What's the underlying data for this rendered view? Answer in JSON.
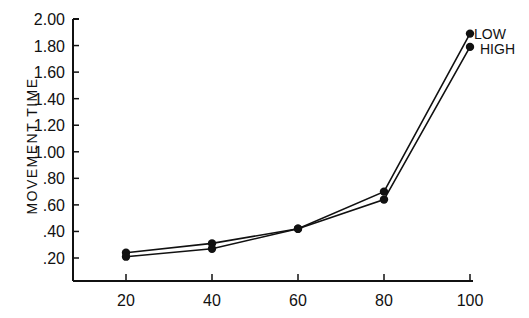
{
  "chart_data": {
    "type": "line",
    "title": "",
    "xlabel": "",
    "ylabel": "MOVEMENT TIME",
    "x": [
      20,
      40,
      60,
      80,
      100
    ],
    "x_tick_labels": [
      "20",
      "40",
      "60",
      "80",
      "100"
    ],
    "y_tick_labels": [
      ".20",
      ".40",
      ".60",
      ".80",
      "1.00",
      "1.20",
      "1.40",
      "1.60",
      "1.80",
      "2.00"
    ],
    "ylim": [
      0.0,
      2.0
    ],
    "xlim": [
      10,
      100
    ],
    "grid": false,
    "legend_position": "inline-right-end",
    "series": [
      {
        "name": "LOW",
        "values": [
          0.24,
          0.31,
          0.42,
          0.7,
          1.89
        ]
      },
      {
        "name": "HIGH",
        "values": [
          0.21,
          0.27,
          0.42,
          0.64,
          1.79
        ]
      }
    ],
    "marker": "filled-circle",
    "color": "#111111"
  },
  "labels": {
    "y_axis_title": "MOVEMENT TIME",
    "legend_low": "LOW",
    "legend_high": "HIGH"
  }
}
